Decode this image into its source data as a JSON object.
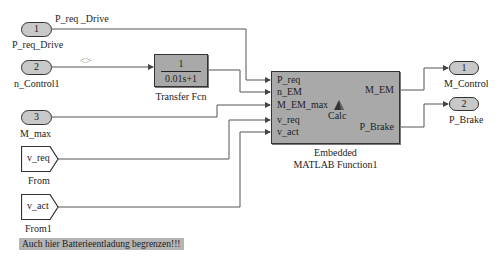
{
  "inports": [
    {
      "number": "1",
      "name": "P_req_Drive"
    },
    {
      "number": "2",
      "name": "n_Control1"
    },
    {
      "number": "3",
      "name": "M_max"
    }
  ],
  "signal_labels": {
    "p_req_drive": "P_req _Drive",
    "n_control_bus": "<>"
  },
  "transfer_fcn": {
    "numerator": "1",
    "denominator": "0.01s+1",
    "name": "Transfer Fcn"
  },
  "from_blocks": [
    {
      "tag": "v_req",
      "name": "From"
    },
    {
      "tag": "v_act",
      "name": "From1"
    }
  ],
  "embedded_function": {
    "inputs": [
      "P_req",
      "n_EM",
      "M_EM_max",
      "v_req",
      "v_act"
    ],
    "outputs": [
      "M_EM",
      "P_Brake"
    ],
    "center_label": "Calc",
    "name_line1": "Embedded",
    "name_line2": "MATLAB Function1"
  },
  "outports": [
    {
      "number": "1",
      "name": "M_Control"
    },
    {
      "number": "2",
      "name": "P_Brake"
    }
  ],
  "annotation": "Auch hier Batterieentladung begrenzen!!!",
  "colors": {
    "block_fill": "#a9a9a9",
    "port_fill": "#c8c8c8",
    "wire": "#555555",
    "annotation_bg": "#b4b4b4"
  }
}
